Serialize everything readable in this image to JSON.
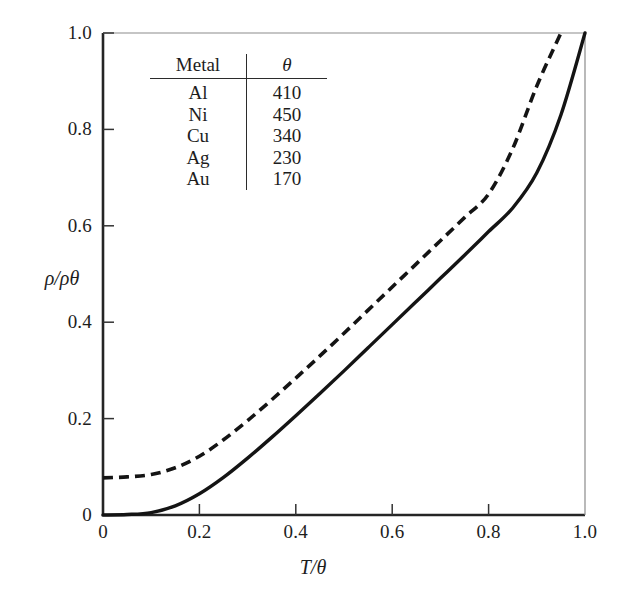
{
  "chart_data": {
    "type": "line",
    "title": "",
    "xlabel": "T/θ",
    "ylabel": "ρ/ρθ",
    "xlim": [
      0,
      1.0
    ],
    "ylim": [
      0,
      1.0
    ],
    "grid": false,
    "legend": "none",
    "xticks": [
      "0",
      "0.2",
      "0.4",
      "0.6",
      "0.8",
      "1.0"
    ],
    "xtick_values": [
      0,
      0.2,
      0.4,
      0.6,
      0.8,
      1.0
    ],
    "yticks": [
      "0",
      "0.2",
      "0.4",
      "0.6",
      "0.8",
      "1.0"
    ],
    "ytick_values": [
      0,
      0.2,
      0.4,
      0.6,
      0.8,
      1.0
    ],
    "x": [
      0.0,
      0.05,
      0.1,
      0.15,
      0.2,
      0.25,
      0.3,
      0.35,
      0.4,
      0.45,
      0.5,
      0.55,
      0.6,
      0.65,
      0.7,
      0.75,
      0.8,
      0.85,
      0.9,
      0.95,
      1.0
    ],
    "series": [
      {
        "name": "ideal",
        "style": "solid",
        "color": "#141414",
        "values": [
          0.0,
          0.001,
          0.005,
          0.019,
          0.044,
          0.078,
          0.118,
          0.161,
          0.206,
          0.252,
          0.299,
          0.347,
          0.395,
          0.443,
          0.491,
          0.539,
          0.588,
          0.637,
          0.71,
          0.83,
          1.0
        ]
      },
      {
        "name": "with-residual-resistivity",
        "style": "dashed",
        "color": "#141414",
        "values": [
          0.077,
          0.079,
          0.084,
          0.098,
          0.122,
          0.156,
          0.196,
          0.239,
          0.284,
          0.33,
          0.377,
          0.425,
          0.473,
          0.521,
          0.569,
          0.617,
          0.666,
          0.76,
          0.89,
          1.0,
          1.0
        ]
      }
    ]
  },
  "inset_table": {
    "name": "debye-temperature-table",
    "headers": [
      "Metal",
      "θ"
    ],
    "rows": [
      {
        "metal": "Al",
        "theta": "410"
      },
      {
        "metal": "Ni",
        "theta": "450"
      },
      {
        "metal": "Cu",
        "theta": "340"
      },
      {
        "metal": "Ag",
        "theta": "230"
      },
      {
        "metal": "Au",
        "theta": "170"
      }
    ]
  },
  "style": {
    "background": "#ffffff",
    "axis_color": "#2b2b2b",
    "curve_color": "#141414"
  }
}
